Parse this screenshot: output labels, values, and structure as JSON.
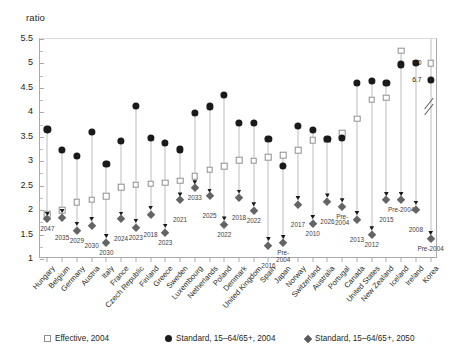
{
  "title_faint": "",
  "axis": {
    "ylabel": "ratio",
    "yticks": [
      "1",
      "1.5",
      "2",
      "2.5",
      "3",
      "3.5",
      "4",
      "4.5",
      "5",
      "5.5"
    ]
  },
  "legend": {
    "items": [
      {
        "marker": "square-open-icon",
        "label": "Effective, 2004"
      },
      {
        "marker": "circle-filled-icon",
        "label": "Standard, 15–64/65+, 2004"
      },
      {
        "marker": "diamond-filled-icon",
        "label": "Standard, 15–64/65+, 2050"
      }
    ]
  },
  "chart_data": {
    "type": "scatter",
    "title": "",
    "xlabel": "",
    "ylabel": "ratio",
    "ylim": [
      1,
      5.5
    ],
    "grid": false,
    "legend_position": "bottom",
    "categories": [
      "Hungary",
      "Belgium",
      "Germany",
      "Austria",
      "Italy",
      "France",
      "Czech Republic",
      "Finland",
      "Greece",
      "Sweden",
      "Luxembourg",
      "Netherlands",
      "Poland",
      "Denmark",
      "United Kingdom",
      "Spain",
      "Japan",
      "Norway",
      "Switzerland",
      "Australia",
      "Portugal",
      "Canada",
      "United States",
      "New Zealand",
      "Iceland",
      "Ireland",
      "Korea"
    ],
    "series": [
      {
        "name": "Effective, 2004",
        "marker": "square-open-icon",
        "values": [
          1.92,
          2.0,
          2.16,
          2.21,
          2.28,
          2.47,
          2.52,
          2.54,
          2.56,
          2.6,
          2.69,
          2.83,
          2.9,
          3.02,
          3.01,
          3.08,
          3.12,
          3.22,
          3.43,
          3.44,
          3.57,
          3.87,
          4.26,
          4.3,
          5.26,
          null,
          9.0
        ]
      },
      {
        "name": "Standard, 15–64/65+, 2004",
        "marker": "circle-filled-icon",
        "values": [
          3.65,
          3.23,
          3.11,
          3.6,
          2.95,
          3.42,
          4.13,
          3.47,
          3.37,
          3.24,
          3.98,
          4.12,
          4.35,
          3.79,
          3.79,
          3.46,
          2.91,
          3.72,
          3.64,
          3.45,
          3.47,
          4.6,
          4.64,
          4.6,
          4.98,
          5.01,
          6.7
        ]
      },
      {
        "name": "Standard, 15–64/65+, 2050",
        "marker": "diamond-filled-icon",
        "values": [
          1.82,
          1.83,
          1.58,
          1.67,
          1.32,
          1.82,
          1.63,
          1.91,
          1.54,
          2.21,
          2.45,
          2.29,
          1.7,
          2.25,
          1.98,
          1.27,
          1.32,
          2.1,
          1.71,
          2.17,
          2.07,
          1.79,
          1.49,
          2.21,
          2.21,
          2.01,
          1.4
        ]
      }
    ],
    "marker_tick_values": [
      1.92,
      1.98,
      1.72,
      1.82,
      1.47,
      1.93,
      1.78,
      2.05,
      1.68,
      2.32,
      2.57,
      2.4,
      1.83,
      2.38,
      2.12,
      1.41,
      1.45,
      2.25,
      1.86,
      2.3,
      2.2,
      1.94,
      1.63,
      2.33,
      2.33,
      2.15,
      1.53
    ],
    "crossover_year_labels": [
      "2047",
      "2035",
      "2029",
      "2030",
      "2030",
      "2024",
      "2023",
      "2018",
      "2023",
      "2021",
      "2033",
      "2025",
      "2022",
      "2018",
      "2022",
      "2016",
      "Pre-2004",
      "2017",
      "2010",
      "2026",
      "Pre-2004",
      "2013",
      "2012",
      "2015",
      "Pre-2004",
      "2008",
      "Pre-2004"
    ],
    "annotations": [
      {
        "label": "9.0",
        "series": "Effective, 2004",
        "category": "Korea"
      },
      {
        "label": "6.7",
        "series": "Standard, 15–64/65+, 2004",
        "category": "Korea"
      }
    ],
    "axis_break": {
      "category": "Korea",
      "note": "broken axis above 5.5"
    }
  }
}
